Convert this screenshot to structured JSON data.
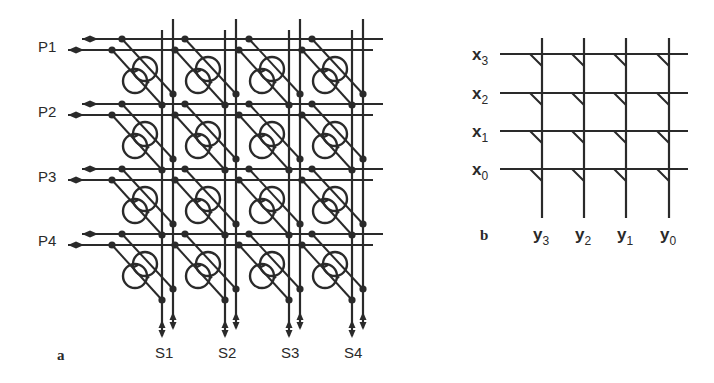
{
  "figure": {
    "panel_a": {
      "label": "a",
      "row_labels": [
        "P1",
        "P2",
        "P3",
        "P4"
      ],
      "column_labels": [
        "S1",
        "S2",
        "S3",
        "S4"
      ],
      "rows_y": [
        [
          39,
          50
        ],
        [
          104,
          115
        ],
        [
          169,
          180
        ],
        [
          234,
          245
        ]
      ],
      "cols_x": [
        [
          162,
          173
        ],
        [
          225,
          236
        ],
        [
          289,
          300
        ],
        [
          352,
          363
        ]
      ],
      "description": "4x4 crossbar of paired bus lines with bidirectional arrows; each crosspoint has a switch element drawn as two overlapping rings connected by diagonal lines with junction dots"
    },
    "panel_b": {
      "label": "b",
      "row_labels": [
        {
          "base": "x",
          "sub": "3"
        },
        {
          "base": "x",
          "sub": "2"
        },
        {
          "base": "x",
          "sub": "1"
        },
        {
          "base": "x",
          "sub": "0"
        }
      ],
      "column_labels": [
        {
          "base": "y",
          "sub": "3"
        },
        {
          "base": "y",
          "sub": "2"
        },
        {
          "base": "y",
          "sub": "1"
        },
        {
          "base": "y",
          "sub": "0"
        }
      ],
      "rows_y": [
        54,
        93,
        131,
        169
      ],
      "cols_x": [
        542,
        584,
        626,
        669
      ],
      "description": "4x4 grid of x lines and y lines with small diagonal tick marks at each crosspoint"
    },
    "colors": {
      "ink": "#2a2a2a",
      "background": "#ffffff"
    }
  }
}
